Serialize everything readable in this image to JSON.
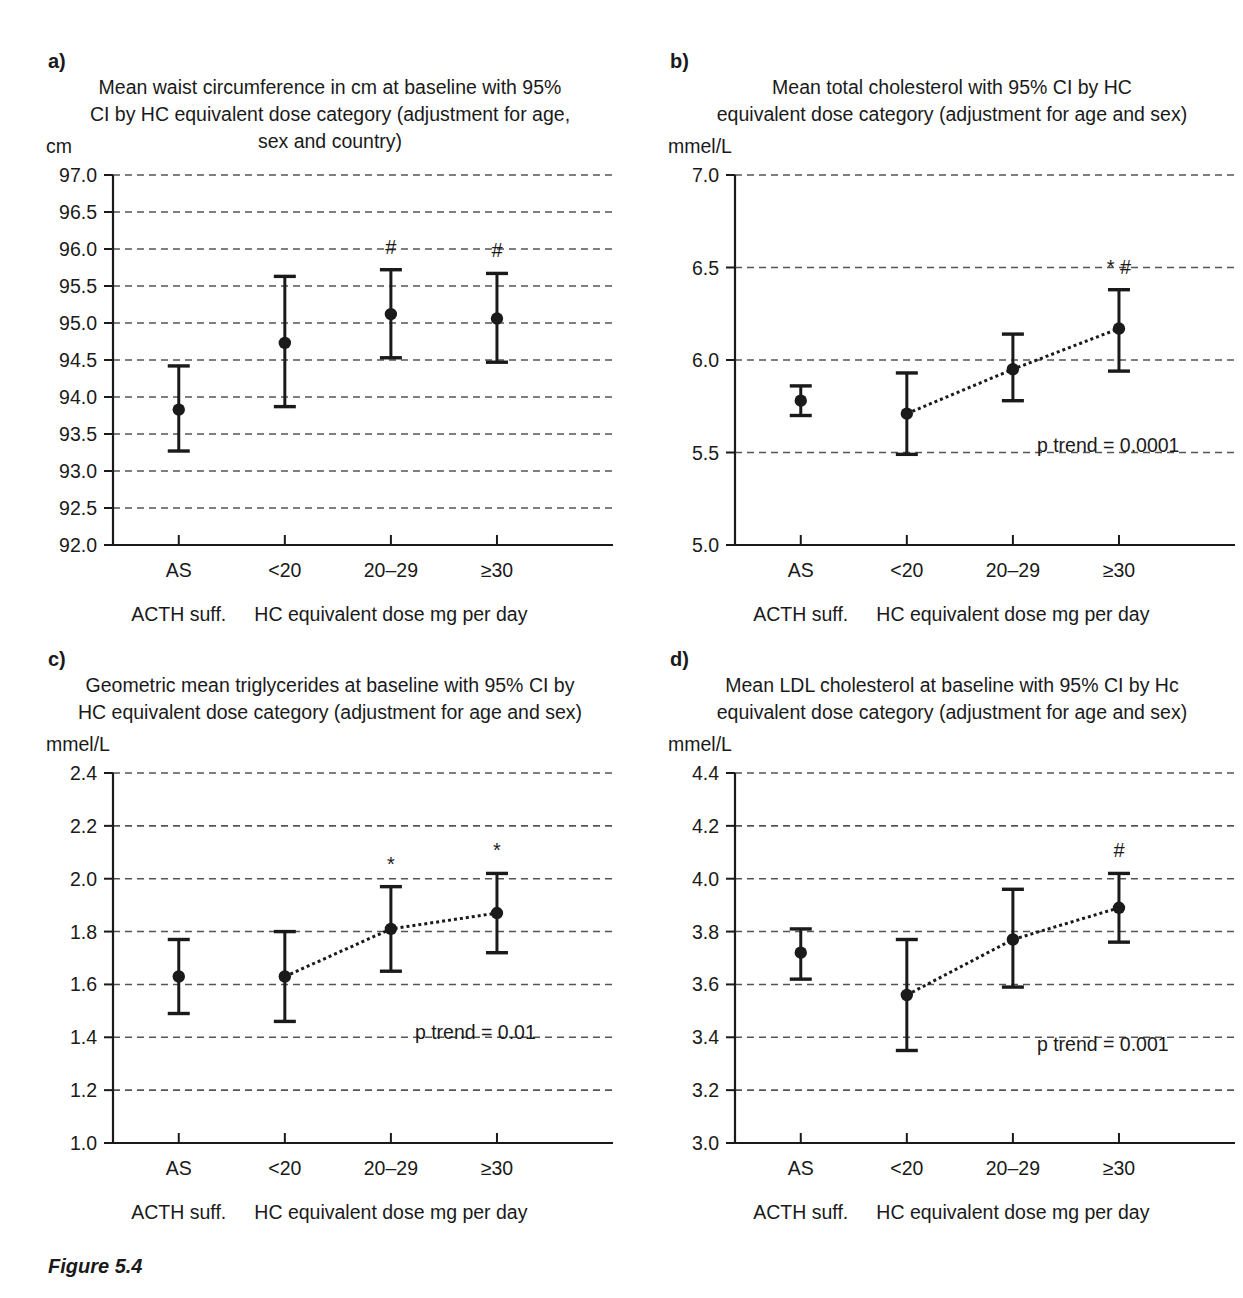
{
  "figure": {
    "caption": "Figure 5.4"
  },
  "axis_common": {
    "categories": [
      "AS",
      "<20",
      "20–29",
      "≥30"
    ],
    "group_label_left": "ACTH suff.",
    "group_label_right": "HC equivalent dose mg per day"
  },
  "chart_data": [
    {
      "panel": "a",
      "letter": "a)",
      "type": "scatter",
      "title": "Mean waist circumference in cm at baseline with 95% CI by HC equivalent dose category (adjustment for age, sex and country)",
      "title_lines": [
        "Mean waist circumference in cm at baseline with 95%",
        "CI by HC equivalent dose category (adjustment for age,",
        "sex and country)"
      ],
      "ylabel": "cm",
      "xlabel": "",
      "ylim": [
        92.0,
        97.0
      ],
      "ytick_step": 0.5,
      "ytick_labels": [
        "92.0",
        "92.5",
        "93.0",
        "93.5",
        "94.0",
        "94.5",
        "95.0",
        "95.5",
        "96.0",
        "96.5",
        "97.0"
      ],
      "grid": true,
      "trend_line": false,
      "p_trend": "",
      "categories": [
        "AS",
        "<20",
        "20–29",
        "≥30"
      ],
      "values": [
        93.83,
        94.73,
        95.12,
        95.06
      ],
      "ci_low": [
        93.27,
        93.87,
        94.53,
        94.47
      ],
      "ci_high": [
        94.42,
        95.63,
        95.72,
        95.67
      ],
      "markers": [
        "",
        "",
        "#",
        "#"
      ]
    },
    {
      "panel": "b",
      "letter": "b)",
      "type": "scatter",
      "title": "Mean total cholesterol with 95% CI by HC equivalent dose category (adjustment for age and sex)",
      "title_lines": [
        "Mean total cholesterol with 95% CI by HC",
        "equivalent dose category (adjustment for age and sex)"
      ],
      "ylabel": "mmel/L",
      "xlabel": "",
      "ylim": [
        5.0,
        7.0
      ],
      "ytick_step": 0.5,
      "ytick_labels": [
        "5.0",
        "5.5",
        "6.0",
        "6.5",
        "7.0"
      ],
      "grid": true,
      "trend_line": true,
      "p_trend": "p trend = 0.0001",
      "categories": [
        "AS",
        "<20",
        "20–29",
        "≥30"
      ],
      "values": [
        5.78,
        5.71,
        5.95,
        6.17
      ],
      "ci_low": [
        5.7,
        5.49,
        5.78,
        5.94
      ],
      "ci_high": [
        5.86,
        5.93,
        6.14,
        6.38
      ],
      "markers": [
        "",
        "",
        "",
        "* #"
      ]
    },
    {
      "panel": "c",
      "letter": "c)",
      "type": "scatter",
      "title": "Geometric mean triglycerides at baseline with 95% CI by HC equivalent dose category (adjustment for age and sex)",
      "title_lines": [
        "Geometric mean triglycerides at baseline with 95% CI by",
        "HC equivalent dose category (adjustment for age and sex)"
      ],
      "ylabel": "mmel/L",
      "xlabel": "",
      "ylim": [
        1.0,
        2.4
      ],
      "ytick_step": 0.2,
      "ytick_labels": [
        "1.0",
        "1.2",
        "1.4",
        "1.6",
        "1.8",
        "2.0",
        "2.2",
        "2.4"
      ],
      "grid": true,
      "trend_line": true,
      "p_trend": "p trend = 0.01",
      "categories": [
        "AS",
        "<20",
        "20–29",
        "≥30"
      ],
      "values": [
        1.63,
        1.63,
        1.81,
        1.87
      ],
      "ci_low": [
        1.49,
        1.46,
        1.65,
        1.72
      ],
      "ci_high": [
        1.77,
        1.8,
        1.97,
        2.02
      ],
      "markers": [
        "",
        "",
        "*",
        "*"
      ]
    },
    {
      "panel": "d",
      "letter": "d)",
      "type": "scatter",
      "title": "Mean LDL cholesterol at baseline with 95% CI by Hc equivalent dose category (adjustment for age and sex)",
      "title_lines": [
        "Mean LDL cholesterol at baseline with 95% CI by Hc",
        "equivalent dose category (adjustment for age and sex)"
      ],
      "ylabel": "mmel/L",
      "xlabel": "",
      "ylim": [
        3.0,
        4.4
      ],
      "ytick_step": 0.2,
      "ytick_labels": [
        "3.0",
        "3.2",
        "3.4",
        "3.6",
        "3.8",
        "4.0",
        "4.2",
        "4.4"
      ],
      "grid": true,
      "trend_line": true,
      "p_trend": "p trend = 0.001",
      "categories": [
        "AS",
        "<20",
        "20–29",
        "≥30"
      ],
      "values": [
        3.72,
        3.56,
        3.77,
        3.89
      ],
      "ci_low": [
        3.62,
        3.35,
        3.59,
        3.76
      ],
      "ci_high": [
        3.81,
        3.77,
        3.96,
        4.02
      ],
      "markers": [
        "",
        "",
        "",
        "#"
      ]
    }
  ]
}
